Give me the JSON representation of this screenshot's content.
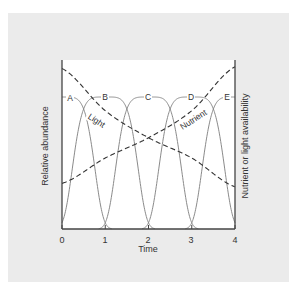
{
  "chart_data": {
    "type": "line",
    "title": "",
    "xlabel": "Time",
    "ylabel_left": "Relative abundance",
    "ylabel_right": "Nutrient or light availability",
    "xlim": [
      0,
      4
    ],
    "xticks": [
      "0",
      "1",
      "2",
      "3",
      "4"
    ],
    "grid": false,
    "legend": "inline labels",
    "species_series": [
      {
        "name": "A",
        "peak_time": 0
      },
      {
        "name": "B",
        "peak_time": 1
      },
      {
        "name": "C",
        "peak_time": 2
      },
      {
        "name": "D",
        "peak_time": 3
      },
      {
        "name": "E",
        "peak_time": 4
      }
    ],
    "resource_series": [
      {
        "name": "Light",
        "style": "dashed",
        "trend": "decreasing",
        "x": [
          0,
          1,
          2,
          3,
          4
        ],
        "relative_values": [
          0.95,
          0.7,
          0.54,
          0.42,
          0.25
        ]
      },
      {
        "name": "Nutrient",
        "style": "dashed",
        "trend": "increasing",
        "x": [
          0,
          1,
          2,
          3,
          4
        ],
        "relative_values": [
          0.27,
          0.42,
          0.54,
          0.7,
          0.96
        ]
      }
    ]
  },
  "labels": {
    "xlabel": "Time",
    "ylabel_left": "Relative abundance",
    "ylabel_right": "Nutrient or light availability",
    "ticks": [
      "0",
      "1",
      "2",
      "3",
      "4"
    ],
    "species": [
      "A",
      "B",
      "C",
      "D",
      "E"
    ],
    "light": "Light",
    "nutrient": "Nutrient"
  }
}
